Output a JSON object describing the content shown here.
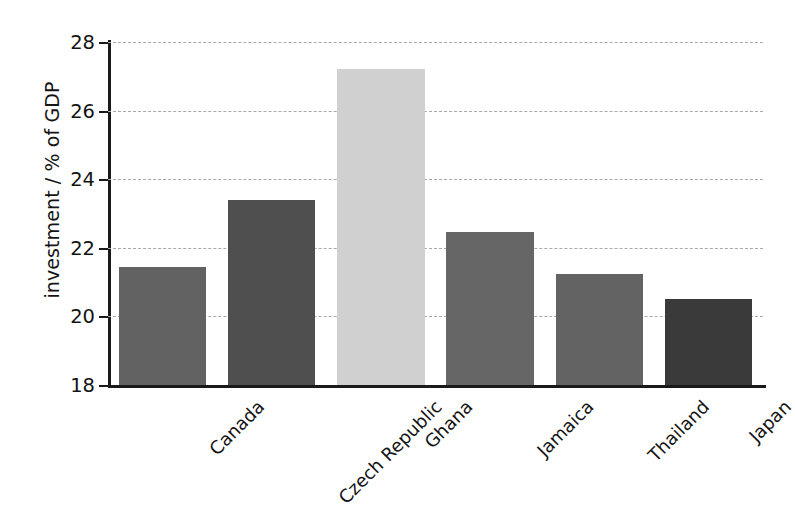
{
  "chart_data": {
    "type": "bar",
    "title": "",
    "xlabel": "",
    "ylabel": "investment / % of GDP",
    "categories": [
      "Canada",
      "Czech Republic",
      "Ghana",
      "Jamaica",
      "Thailand",
      "Japan"
    ],
    "values": [
      21.45,
      23.4,
      27.2,
      22.45,
      21.25,
      20.5
    ],
    "bar_colors": [
      "#626262",
      "#4f4f4f",
      "#d0d0d0",
      "#666666",
      "#636363",
      "#3a3a3a"
    ],
    "ylim": [
      18,
      28
    ],
    "yticks": [
      18,
      20,
      22,
      24,
      26,
      28
    ],
    "ytick_labels": [
      "18",
      "20",
      "22",
      "24",
      "26",
      "28"
    ],
    "grid": true,
    "grid_axis": "y",
    "grid_style": "dashed",
    "grid_color": "#a9a9a9",
    "legend": null,
    "legend_position": "none",
    "xtick_rotation": -45,
    "axis_color": "#1a1a1a",
    "background_color": "#ffffff"
  },
  "figure": {
    "y_axis_title": "investment / % of GDP"
  }
}
